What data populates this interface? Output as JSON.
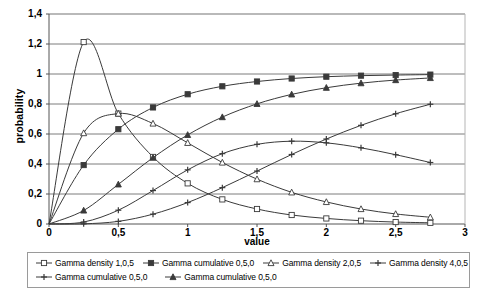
{
  "chart_data": {
    "type": "line",
    "title": "",
    "xlabel": "value",
    "ylabel": "probability",
    "xlim": [
      0,
      3
    ],
    "ylim": [
      0,
      1.4
    ],
    "xticks": [
      "0",
      "0,5",
      "1",
      "1,5",
      "2",
      "2,5",
      "3"
    ],
    "xtick_values": [
      0,
      0.5,
      1,
      1.5,
      2,
      2.5,
      3
    ],
    "yticks": [
      "0",
      "0,2",
      "0,4",
      "0,6",
      "0,8",
      "1",
      "1,2",
      "1,4"
    ],
    "ytick_values": [
      0,
      0.2,
      0.4,
      0.6,
      0.8,
      1.0,
      1.2,
      1.4
    ],
    "grid": "horizontal",
    "legend_position": "bottom",
    "x": [
      0,
      0.25,
      0.5,
      0.75,
      1,
      1.25,
      1.5,
      1.75,
      2,
      2.25,
      2.5,
      2.75
    ],
    "series": [
      {
        "name": "Gamma density 1,0,5",
        "marker": "open-square",
        "values": [
          0,
          1.213,
          0.736,
          0.447,
          0.271,
          0.164,
          0.1,
          0.06,
          0.037,
          0.022,
          0.013,
          0.008
        ]
      },
      {
        "name": "Gamma cumulative 0,5,0",
        "marker": "filled-square",
        "values": [
          0,
          0.393,
          0.632,
          0.777,
          0.865,
          0.918,
          0.95,
          0.97,
          0.982,
          0.989,
          0.993,
          0.996
        ]
      },
      {
        "name": "Gamma density 2,0,5",
        "marker": "open-triangle",
        "values": [
          0,
          0.606,
          0.736,
          0.67,
          0.541,
          0.41,
          0.299,
          0.211,
          0.147,
          0.1,
          0.067,
          0.045
        ]
      },
      {
        "name": "Gamma density 4,0,5",
        "marker": "cross",
        "values": [
          0,
          0.013,
          0.092,
          0.223,
          0.361,
          0.469,
          0.531,
          0.552,
          0.541,
          0.508,
          0.462,
          0.41
        ]
      },
      {
        "name": "Gamma cumulative 0,5,0",
        "marker": "cross",
        "values": [
          0,
          0.0011,
          0.0175,
          0.0656,
          0.1429,
          0.2424,
          0.3528,
          0.4634,
          0.5665,
          0.6577,
          0.735,
          0.7983
        ]
      },
      {
        "name": "Gamma cumulative 0,5,0",
        "marker": "filled-triangle",
        "values": [
          0,
          0.0902,
          0.2642,
          0.4422,
          0.594,
          0.7127,
          0.8009,
          0.8641,
          0.9084,
          0.9389,
          0.9596,
          0.9735
        ]
      }
    ]
  },
  "legend": {
    "row1": [
      {
        "label": "Gamma density 1,0,5",
        "marker": "open-square"
      },
      {
        "label": "Gamma cumulative 0,5,0",
        "marker": "filled-square"
      },
      {
        "label": "Gamma density 2,0,5",
        "marker": "open-triangle"
      },
      {
        "label": "Gamma density 4,0,5",
        "marker": "cross"
      }
    ],
    "row2": [
      {
        "label": "Gamma cumulative 0,5,0",
        "marker": "cross"
      },
      {
        "label": "Gamma cumulative 0,5,0",
        "marker": "filled-triangle"
      }
    ]
  },
  "colors": {
    "line": "#3a3a3a",
    "grid": "#7d7d7d",
    "axis": "#555555",
    "text": "#000000",
    "background": "#ffffff"
  }
}
